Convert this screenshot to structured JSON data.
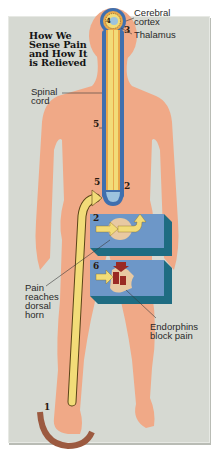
{
  "title": "How We\nSense Pain\nand How It\nis Relieved",
  "labels": {
    "cerebral_cortex": "Cerebral\ncortex",
    "thalamus": "Thalamus",
    "spinal_cord": "Spinal\ncord",
    "dorsal_horn": "Pain\nreaches\ndorsal\nhorn",
    "endorphins": "Endorphins\nblock pain"
  },
  "step_numbers": {
    "foot": "1",
    "cord_base_right": "2",
    "box_top": "2",
    "brain": "3",
    "brain_inner": "4",
    "cord_mid": "5",
    "cord_base_left": "5",
    "box_bottom": "6"
  },
  "colors": {
    "background": "#d6d9d2",
    "skin": "#f0a987",
    "cord_blue": "#3f6fae",
    "nerve_yellow": "#f2dc78",
    "box_blue": "#6d97c8",
    "box_dark": "#1f6c82",
    "endorphin_red": "#9a2a24",
    "foot_arc": "#9c5a40"
  }
}
